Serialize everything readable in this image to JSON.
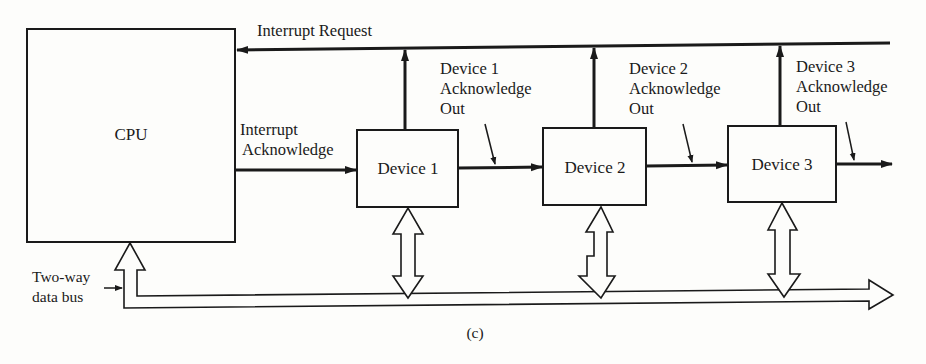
{
  "diagram": {
    "caption": "(c)",
    "cpu": {
      "label": "CPU"
    },
    "signals": {
      "interrupt_request": "Interrupt Request",
      "interrupt_ack_line1": "Interrupt",
      "interrupt_ack_line2": "Acknowledge",
      "data_bus_line1": "Two-way",
      "data_bus_line2": "data bus"
    },
    "devices": [
      {
        "label": "Device 1",
        "ack_out": [
          "Device 1",
          "Acknowledge",
          "Out"
        ]
      },
      {
        "label": "Device 2",
        "ack_out": [
          "Device 2",
          "Acknowledge",
          "Out"
        ]
      },
      {
        "label": "Device 3",
        "ack_out": [
          "Device 3",
          "Acknowledge",
          "Out"
        ]
      }
    ],
    "colors": {
      "ink": "#1a1a1a",
      "paper": "#fdfdfb"
    }
  }
}
